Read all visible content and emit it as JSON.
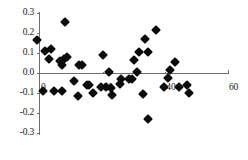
{
  "chart_data": {
    "type": "scatter",
    "title": "",
    "subtitle": "",
    "xlabel": "",
    "ylabel": "",
    "xlim": [
      -2,
      62
    ],
    "ylim": [
      -0.3,
      0.3
    ],
    "xticks": [
      0,
      20,
      40,
      60
    ],
    "xtick_labels": [
      "0",
      "20",
      "40",
      "60"
    ],
    "yticks": [
      -0.3,
      -0.2,
      -0.1,
      0.0,
      0.1,
      0.2,
      0.3
    ],
    "ytick_labels": [
      "-0.3",
      "-0.2",
      "-0.1",
      "0.0",
      "0.1",
      "0.2",
      "0.3"
    ],
    "grid": false,
    "legend": null,
    "legend_position": "none",
    "marker": "diamond",
    "marker_color": "#0b0b0b",
    "axis_color": "#6e6e6e",
    "zero_line": true,
    "series": [
      {
        "name": "residuals",
        "points": [
          [
            -1.0,
            0.165
          ],
          [
            1.5,
            0.108
          ],
          [
            3.5,
            0.118
          ],
          [
            3.0,
            0.072
          ],
          [
            8.0,
            0.253
          ],
          [
            7.5,
            0.068
          ],
          [
            8.5,
            0.078
          ],
          [
            6.5,
            0.062
          ],
          [
            7.0,
            0.04
          ],
          [
            12.5,
            0.04
          ],
          [
            13.5,
            0.038
          ],
          [
            20.0,
            0.09
          ],
          [
            22.0,
            0.006
          ],
          [
            31.0,
            0.003
          ],
          [
            30.0,
            0.063
          ],
          [
            31.5,
            0.105
          ],
          [
            34.5,
            0.105
          ],
          [
            33.5,
            0.172
          ],
          [
            37.0,
            0.215
          ],
          [
            43.0,
            0.057
          ],
          [
            41.5,
            0.015
          ],
          [
            1.0,
            -0.09
          ],
          [
            4.5,
            -0.09
          ],
          [
            7.0,
            -0.09
          ],
          [
            11.0,
            -0.042
          ],
          [
            12.0,
            -0.115
          ],
          [
            15.0,
            -0.062
          ],
          [
            15.5,
            -0.058
          ],
          [
            17.0,
            -0.1
          ],
          [
            19.5,
            -0.07
          ],
          [
            21.0,
            -0.072
          ],
          [
            22.5,
            -0.075
          ],
          [
            23.0,
            -0.112
          ],
          [
            25.5,
            -0.055
          ],
          [
            26.0,
            -0.028
          ],
          [
            28.5,
            -0.03
          ],
          [
            29.5,
            -0.028
          ],
          [
            33.0,
            -0.105
          ],
          [
            39.5,
            -0.068
          ],
          [
            41.0,
            -0.025
          ],
          [
            44.5,
            -0.07
          ],
          [
            47.0,
            -0.062
          ],
          [
            47.5,
            -0.1
          ],
          [
            34.5,
            -0.232
          ]
        ]
      }
    ]
  },
  "axes": {
    "y_axis_name": "y-axis",
    "x_axis_name": "x-axis"
  }
}
